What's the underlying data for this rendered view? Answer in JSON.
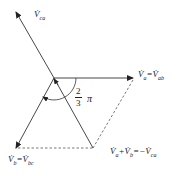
{
  "diagram": {
    "type": "phasor-diagram",
    "colors": {
      "line": "#333333",
      "dashed": "#555555",
      "text": "#222222"
    },
    "origin": [
      54,
      78
    ],
    "vectors": [
      {
        "id": "Va",
        "label": "V̇a = V̇ab",
        "from": [
          54,
          78
        ],
        "to": [
          133,
          78
        ],
        "style": "solid-arrow"
      },
      {
        "id": "Vca",
        "label": "V̇ca",
        "from": [
          54,
          78
        ],
        "to": [
          16,
          12
        ],
        "style": "solid-arrow"
      },
      {
        "id": "Vb",
        "label": "V̇b = V̇bc",
        "from": [
          54,
          78
        ],
        "to": [
          16,
          148
        ],
        "style": "solid-arrow"
      },
      {
        "id": "VaPlusVb",
        "label": "V̇a + V̇b = −V̇ca",
        "from": [
          54,
          78
        ],
        "to": [
          93,
          148
        ],
        "style": "solid-line"
      }
    ],
    "dashed_lines": [
      {
        "from": [
          133,
          78
        ],
        "to": [
          93,
          148
        ]
      },
      {
        "from": [
          16,
          148
        ],
        "to": [
          93,
          148
        ]
      }
    ],
    "angle_label": {
      "numerator": "2",
      "denominator": "3",
      "symbol": "π"
    }
  },
  "labels": {
    "vca": "V̇",
    "vca_sub": "ca",
    "va_lhs": "V̇",
    "va_lhs_sub": "a",
    "va_eq": "=",
    "va_rhs": "V̇",
    "va_rhs_sub": "ab",
    "vb_lhs": "V̇",
    "vb_lhs_sub": "b",
    "vb_eq": "=",
    "vb_rhs": "V̇",
    "vb_rhs_sub": "bc",
    "sum_a": "V̇",
    "sum_a_sub": "a",
    "sum_plus": "+",
    "sum_b": "V̇",
    "sum_b_sub": "b",
    "sum_eq": "=",
    "sum_neg": "−",
    "sum_ca": "V̇",
    "sum_ca_sub": "ca",
    "angle_num": "2",
    "angle_den": "3",
    "angle_pi": "π"
  }
}
